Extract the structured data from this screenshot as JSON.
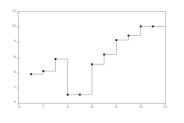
{
  "chart_data": {
    "type": "line",
    "drawstyle": "steps-post",
    "title": "",
    "xlabel": "",
    "ylabel": "",
    "xlim": [
      0,
      12
    ],
    "ylim": [
      0,
      12
    ],
    "grid": false,
    "legend": null,
    "xticks": [
      0,
      2,
      4,
      6,
      8,
      10,
      12
    ],
    "xtick_labels": [
      "0",
      "2",
      "4",
      "6",
      "8",
      "10",
      "12"
    ],
    "yticks": [
      0,
      2,
      4,
      6,
      8,
      10,
      12
    ],
    "ytick_labels": [
      "0",
      "2",
      "4",
      "6",
      "8",
      "10",
      "12"
    ],
    "marker": "square",
    "marker_color": "#2b2b2b",
    "line_color": "#9a9a9a",
    "x": [
      1,
      2,
      3,
      4,
      5,
      6,
      7,
      8,
      9,
      10,
      11
    ],
    "y": [
      3.8,
      4.2,
      5.8,
      1.1,
      1.1,
      5.1,
      6.4,
      8.3,
      8.9,
      10.1,
      10.1
    ],
    "series": [
      {
        "name": "series-1",
        "x": [
          1,
          2,
          3,
          4,
          5,
          6,
          7,
          8,
          9,
          10,
          11
        ],
        "values": [
          3.8,
          4.2,
          5.8,
          1.1,
          1.1,
          5.1,
          6.4,
          8.3,
          8.9,
          10.1,
          10.1
        ]
      }
    ]
  }
}
